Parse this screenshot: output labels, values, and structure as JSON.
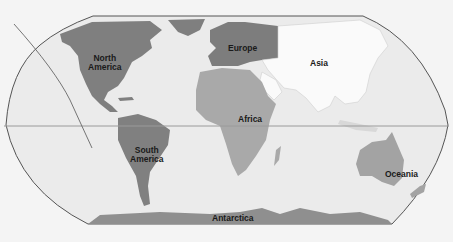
{
  "map": {
    "type": "world-continents",
    "projection": "Robinson",
    "colors": {
      "background": "#f4f4f4",
      "ocean": "#ebebeb",
      "outline": "#555555",
      "equator": "#9a9a9a",
      "north_america": "#7f7f7f",
      "south_america": "#808080",
      "europe": "#7d7d7d",
      "asia": "#fafafa",
      "africa": "#a9a9a9",
      "oceania": "#a3a3a3",
      "antarctica": "#8f8f8f",
      "greenland": "#7f7f7f"
    },
    "labels": {
      "north_america": "North\nAmerica",
      "south_america": "South\nAmerica",
      "europe": "Europe",
      "asia": "Asia",
      "africa": "Africa",
      "oceania": "Oceania",
      "antarctica": "Antarctica"
    }
  }
}
